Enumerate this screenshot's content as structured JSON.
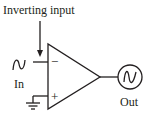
{
  "diagram": {
    "title": "Inverting input",
    "input_label": "In",
    "output_label": "Out",
    "inverting_sign": "−",
    "noninverting_sign": "+",
    "components": [
      {
        "name": "op-amp",
        "symbol": "triangle"
      },
      {
        "name": "input-source",
        "symbol": "sine-wave"
      },
      {
        "name": "output",
        "symbol": "sine-wave-in-circle"
      },
      {
        "name": "ground",
        "symbol": "ground"
      }
    ],
    "colors": {
      "ink": "#231f20",
      "background": "#ffffff"
    }
  }
}
